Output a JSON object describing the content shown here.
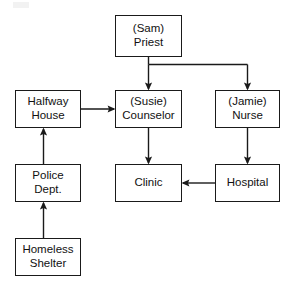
{
  "diagram": {
    "type": "directed-graph",
    "background_color": "#ffffff",
    "stroke_color": "#1a1a1a",
    "text_color": "#111111",
    "nodes": [
      {
        "id": "sam",
        "line1": "(Sam)",
        "line2": "Priest"
      },
      {
        "id": "halfway",
        "line1": "Halfway",
        "line2": "House"
      },
      {
        "id": "susie",
        "line1": "(Susie)",
        "line2": "Counselor"
      },
      {
        "id": "jamie",
        "line1": "(Jamie)",
        "line2": "Nurse"
      },
      {
        "id": "police",
        "line1": "Police",
        "line2": "Dept."
      },
      {
        "id": "clinic",
        "line1": "Clinic",
        "line2": ""
      },
      {
        "id": "hospital",
        "line1": "Hospital",
        "line2": ""
      },
      {
        "id": "homeless",
        "line1": "Homeless",
        "line2": "Shelter"
      }
    ],
    "edges": [
      {
        "from": "sam",
        "to": "susie",
        "style": "elbow-down"
      },
      {
        "from": "sam",
        "to": "jamie",
        "style": "elbow-down"
      },
      {
        "from": "halfway",
        "to": "susie",
        "style": "straight-right"
      },
      {
        "from": "susie",
        "to": "clinic",
        "style": "straight-down"
      },
      {
        "from": "jamie",
        "to": "hospital",
        "style": "straight-down"
      },
      {
        "from": "hospital",
        "to": "clinic",
        "style": "straight-left"
      },
      {
        "from": "police",
        "to": "halfway",
        "style": "straight-up"
      },
      {
        "from": "homeless",
        "to": "police",
        "style": "straight-up"
      }
    ]
  }
}
